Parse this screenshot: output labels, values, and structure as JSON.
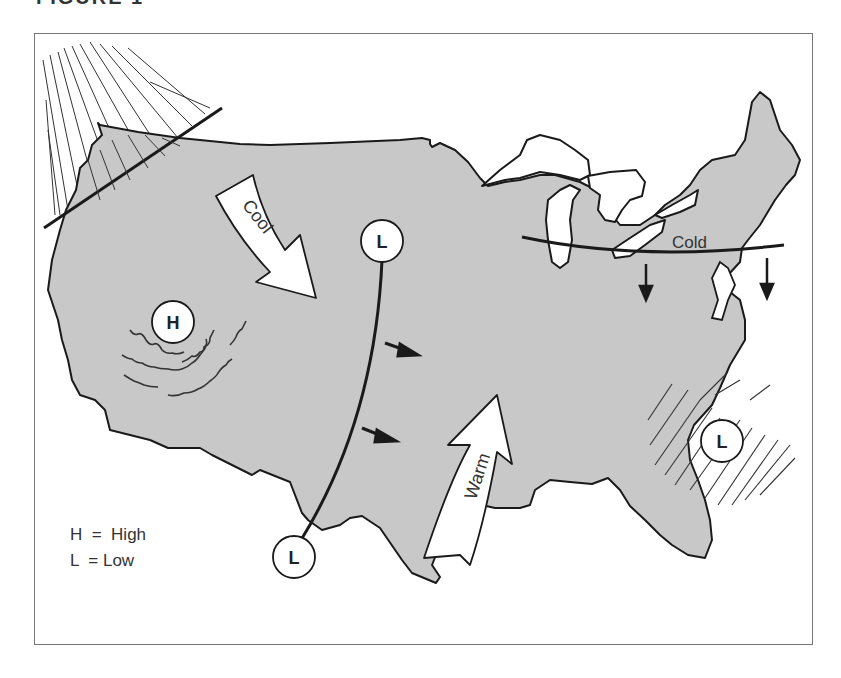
{
  "figure": {
    "title": "FIGURE 1",
    "title_visible": "partially clipped at top edge"
  },
  "map": {
    "region": "Continental United States",
    "land_fill": "#c8c8c8",
    "outline_color": "#1a1a1a"
  },
  "pressure_systems": [
    {
      "symbol": "H",
      "meaning": "High",
      "location": "west (Great Basin)",
      "cx": 173,
      "cy": 322
    },
    {
      "symbol": "L",
      "meaning": "Low",
      "location": "north-central plains",
      "cx": 382,
      "cy": 241
    },
    {
      "symbol": "L",
      "meaning": "Low",
      "location": "southwest (Mexico border)",
      "cx": 294,
      "cy": 557
    },
    {
      "symbol": "L",
      "meaning": "Low",
      "location": "off southeast coast (Atlantic)",
      "cx": 722,
      "cy": 441
    }
  ],
  "air_masses": [
    {
      "label": "Cool",
      "direction": "from northwest toward southeast"
    },
    {
      "label": "Warm",
      "direction": "from Gulf of Mexico northward"
    }
  ],
  "fronts": [
    {
      "label": "Cold",
      "location": "Great Lakes to Northeast",
      "movement": "southward"
    },
    {
      "label": "",
      "location": "central front from north-central L to southwest L",
      "movement": "eastward"
    },
    {
      "label": "",
      "location": "Pacific Northwest coast",
      "precipitation": "hatched"
    }
  ],
  "legend": {
    "items": [
      {
        "text": "H  =  High"
      },
      {
        "text": "L  = Low"
      }
    ]
  }
}
